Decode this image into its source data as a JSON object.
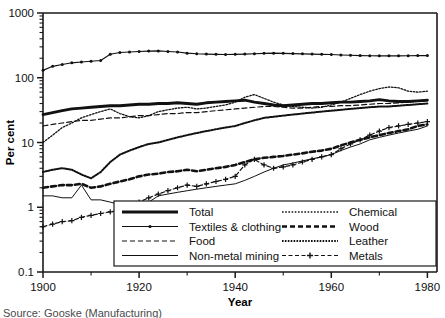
{
  "chart_data": {
    "type": "line",
    "title": "",
    "xlabel": "Year",
    "ylabel": "Per cent",
    "yscale": "log",
    "ylim": [
      0.1,
      1000
    ],
    "xlim": [
      1900,
      1982
    ],
    "ytick_labels": [
      "0.1",
      "1",
      "10",
      "100",
      "1000"
    ],
    "ytick_values": [
      0.1,
      1,
      10,
      100,
      1000
    ],
    "xtick_labels": [
      "1900",
      "1920",
      "1940",
      "1960",
      "1980"
    ],
    "xtick_values": [
      1900,
      1920,
      1940,
      1960,
      1980
    ],
    "grid": false,
    "legend_position": "bottom-right-inside",
    "x": [
      1900,
      1902,
      1904,
      1906,
      1908,
      1910,
      1912,
      1914,
      1916,
      1918,
      1920,
      1922,
      1924,
      1926,
      1928,
      1930,
      1932,
      1934,
      1936,
      1938,
      1940,
      1942,
      1944,
      1946,
      1948,
      1950,
      1952,
      1954,
      1956,
      1958,
      1960,
      1962,
      1964,
      1966,
      1968,
      1970,
      1972,
      1974,
      1976,
      1978,
      1980
    ],
    "series": [
      {
        "name": "Total",
        "style": "thick-solid",
        "values": [
          27,
          29,
          31,
          33,
          34,
          35,
          36,
          37,
          37,
          38,
          39,
          39,
          40,
          40,
          41,
          40,
          39,
          41,
          42,
          43,
          44,
          45,
          42,
          40,
          38,
          37,
          38,
          39,
          40,
          40,
          41,
          42,
          42,
          43,
          44,
          46,
          44,
          43,
          43,
          44,
          45
        ]
      },
      {
        "name": "Textiles & clothing",
        "style": "thin-solid-dot",
        "values": [
          130,
          150,
          160,
          170,
          175,
          180,
          185,
          230,
          245,
          250,
          255,
          258,
          260,
          255,
          250,
          240,
          235,
          232,
          230,
          228,
          230,
          232,
          235,
          238,
          240,
          238,
          236,
          234,
          232,
          230,
          228,
          225,
          222,
          220,
          219,
          218,
          218,
          218,
          219,
          220,
          220
        ]
      },
      {
        "name": "Food",
        "style": "dashed",
        "values": [
          18,
          19,
          20,
          21,
          22,
          22,
          23,
          24,
          24,
          25,
          26,
          26,
          27,
          28,
          28,
          29,
          29,
          30,
          31,
          32,
          33,
          34,
          35,
          36,
          36,
          35,
          34,
          34,
          35,
          36,
          36,
          37,
          37,
          38,
          39,
          40,
          40,
          41,
          42,
          44,
          46
        ]
      },
      {
        "name": "Non-metal mining",
        "style": "thin-solid",
        "values": [
          1.5,
          1.5,
          1.4,
          1.4,
          2.2,
          1.3,
          1.3,
          1.2,
          1.1,
          0.9,
          0.85,
          1.2,
          1.5,
          1.6,
          1.7,
          1.8,
          1.9,
          2.0,
          2.1,
          2.2,
          2.3,
          2.6,
          3.0,
          3.5,
          4.0,
          4.5,
          4.8,
          5.2,
          5.6,
          6.0,
          6.5,
          7.5,
          8.5,
          9.5,
          11,
          12,
          13,
          14,
          15,
          16,
          18
        ]
      },
      {
        "name": "Chemical",
        "style": "fine-dotted",
        "values": [
          10,
          13,
          17,
          20,
          24,
          27,
          30,
          33,
          28,
          25,
          24,
          26,
          30,
          32,
          34,
          35,
          33,
          34,
          36,
          38,
          42,
          50,
          55,
          48,
          42,
          38,
          36,
          35,
          34,
          35,
          38,
          42,
          48,
          55,
          62,
          68,
          72,
          70,
          62,
          60,
          62
        ]
      },
      {
        "name": "Wood",
        "style": "thick-dashed",
        "values": [
          2.0,
          2.1,
          2.2,
          2.2,
          2.3,
          2.0,
          2.1,
          2.3,
          2.5,
          2.7,
          3.0,
          3.2,
          3.3,
          3.5,
          3.6,
          3.8,
          3.6,
          3.8,
          4.0,
          4.2,
          4.5,
          5.0,
          5.5,
          5.8,
          6.0,
          6.2,
          6.5,
          6.8,
          7.2,
          7.5,
          8.0,
          9.0,
          10,
          11,
          12,
          13,
          14,
          15,
          16,
          18,
          19
        ]
      },
      {
        "name": "Leather",
        "style": "dense-dotted",
        "values": [
          3.5,
          3.8,
          4.0,
          3.8,
          3.2,
          2.8,
          3.5,
          5.0,
          6.5,
          7.5,
          8.5,
          9.5,
          10,
          11,
          12,
          13,
          14,
          15,
          16,
          17,
          18,
          20,
          22,
          24,
          25,
          26,
          27,
          28,
          29,
          30,
          31,
          32,
          33,
          34,
          35,
          36,
          36,
          37,
          38,
          39,
          40
        ]
      },
      {
        "name": "Metals",
        "style": "dashed-plus",
        "values": [
          0.5,
          0.55,
          0.6,
          0.62,
          0.7,
          0.75,
          0.8,
          0.85,
          0.9,
          1.0,
          1.2,
          1.4,
          1.6,
          1.8,
          2.0,
          2.2,
          2.1,
          2.3,
          2.5,
          2.7,
          3.0,
          4.5,
          5.5,
          4.5,
          4.0,
          4.2,
          4.5,
          5.0,
          5.5,
          6.0,
          6.5,
          8.0,
          9.5,
          11,
          13,
          15,
          17,
          18,
          19,
          20,
          21
        ]
      }
    ]
  },
  "axes": {
    "y_label": "Per cent",
    "x_label": "Year",
    "y_ticks": [
      "1000",
      "100",
      "10",
      "1",
      "0.1"
    ],
    "x_ticks": [
      "1900",
      "1920",
      "1940",
      "1960",
      "1980"
    ]
  },
  "legend": {
    "entries": [
      {
        "label": "Total",
        "style": "thick-solid"
      },
      {
        "label": "Textiles & clothing",
        "style": "thin-solid-dot"
      },
      {
        "label": "Food",
        "style": "dashed"
      },
      {
        "label": "Non-metal mining",
        "style": "thin-solid"
      },
      {
        "label": "Chemical",
        "style": "fine-dotted"
      },
      {
        "label": "Wood",
        "style": "thick-dashed"
      },
      {
        "label": "Leather",
        "style": "dense-dotted"
      },
      {
        "label": "Metals",
        "style": "dashed-plus"
      }
    ]
  },
  "caption": {
    "text": "Source: Gooske (Manufacturing)"
  }
}
